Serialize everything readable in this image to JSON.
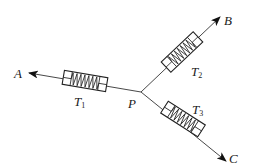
{
  "diagram": {
    "junction": {
      "label": "P",
      "x": 141,
      "y": 92
    },
    "strings": [
      {
        "id": "A",
        "label": "A",
        "tip": [
          29,
          73
        ],
        "label_pos": [
          14,
          78
        ]
      },
      {
        "id": "B",
        "label": "B",
        "tip": [
          220,
          17
        ],
        "label_pos": [
          224,
          25
        ]
      },
      {
        "id": "C",
        "label": "C",
        "tip": [
          226,
          161
        ],
        "label_pos": [
          229,
          163
        ]
      }
    ],
    "spring_scales": [
      {
        "id": "T1",
        "label": "T",
        "subscript": "1",
        "on_string": "A",
        "center": [
          85,
          81
        ],
        "angle": 9.5
      },
      {
        "id": "T2",
        "label": "T",
        "subscript": "2",
        "on_string": "B",
        "center": [
          182,
          52
        ],
        "angle": -43.5
      },
      {
        "id": "T3",
        "label": "T",
        "subscript": "3",
        "on_string": "C",
        "center": [
          183,
          119
        ],
        "angle": 32.7
      }
    ]
  }
}
